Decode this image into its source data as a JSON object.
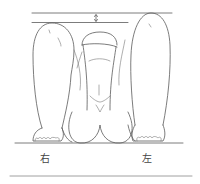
{
  "figure": {
    "labels": {
      "right": "右",
      "left": "左"
    },
    "annotations": {
      "height_difference_arrow": "double-headed arrow between knee-level reference lines"
    },
    "colors": {
      "line": "#5a5a5a",
      "background": "#ffffff"
    }
  }
}
